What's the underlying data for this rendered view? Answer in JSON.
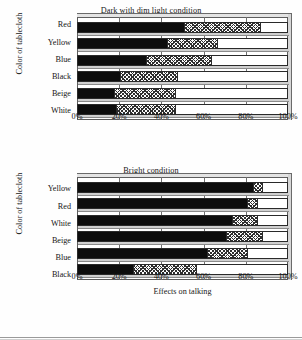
{
  "figure": {
    "background": "#ffffff",
    "ink": "#161616"
  },
  "charts": [
    {
      "id": "dark-dim-light",
      "title": "Dark with dim light condition",
      "ylabel": "Color of tablecloth",
      "xlabel": "",
      "xticks": [
        "0%",
        "20%",
        "40%",
        "60%",
        "80%",
        "100%"
      ],
      "xtick_values": [
        0,
        20,
        40,
        60,
        80,
        100
      ],
      "categories": [
        "Red",
        "Yellow",
        "Blue",
        "Black",
        "Beige",
        "White"
      ],
      "series": [
        {
          "name": "solid-black",
          "fill": "solid",
          "values": [
            51,
            43,
            33,
            21,
            18,
            19
          ]
        },
        {
          "name": "cross-hatch",
          "fill": "hatch",
          "values": [
            36,
            24,
            31,
            27,
            29,
            28
          ]
        },
        {
          "name": "open-white",
          "fill": "open",
          "values": [
            13,
            33,
            36,
            52,
            53,
            53
          ]
        }
      ],
      "cumulative": [
        {
          "category": "Red",
          "solid_end": 51,
          "hatch_end": 87
        },
        {
          "category": "Yellow",
          "solid_end": 43,
          "hatch_end": 67
        },
        {
          "category": "Blue",
          "solid_end": 33,
          "hatch_end": 64
        },
        {
          "category": "Black",
          "solid_end": 21,
          "hatch_end": 48
        },
        {
          "category": "Beige",
          "solid_end": 18,
          "hatch_end": 47
        },
        {
          "category": "White",
          "solid_end": 19,
          "hatch_end": 47
        }
      ]
    },
    {
      "id": "bright",
      "title": "Bright condition",
      "ylabel": "Color of tablecloth",
      "xlabel": "Effects on talking",
      "xticks": [
        "0%",
        "20%",
        "40%",
        "60%",
        "80%",
        "100%"
      ],
      "xtick_values": [
        0,
        20,
        40,
        60,
        80,
        100
      ],
      "categories": [
        "Yellow",
        "Red",
        "White",
        "Beige",
        "Blue",
        "Black"
      ],
      "series": [
        {
          "name": "solid-black",
          "fill": "solid",
          "values": [
            84,
            81,
            74,
            71,
            62,
            27
          ]
        },
        {
          "name": "cross-hatch",
          "fill": "hatch",
          "values": [
            4,
            5,
            12,
            17,
            19,
            30
          ]
        },
        {
          "name": "open-white",
          "fill": "open",
          "values": [
            12,
            14,
            14,
            12,
            19,
            43
          ]
        }
      ],
      "cumulative": [
        {
          "category": "Yellow",
          "solid_end": 84,
          "hatch_end": 88
        },
        {
          "category": "Red",
          "solid_end": 81,
          "hatch_end": 86
        },
        {
          "category": "White",
          "solid_end": 74,
          "hatch_end": 86
        },
        {
          "category": "Beige",
          "solid_end": 71,
          "hatch_end": 88
        },
        {
          "category": "Blue",
          "solid_end": 62,
          "hatch_end": 81
        },
        {
          "category": "Black",
          "solid_end": 27,
          "hatch_end": 57
        }
      ]
    }
  ],
  "chart_data": {
    "type": "bar",
    "orientation": "horizontal",
    "stacked": true,
    "normalized_percent": true,
    "panels": [
      {
        "title": "Dark with dim light condition",
        "xlabel": "",
        "ylabel": "Color of tablecloth",
        "xlim": [
          0,
          100
        ],
        "xticks": [
          0,
          20,
          40,
          60,
          80,
          100
        ],
        "xticklabels": [
          "0%",
          "20%",
          "40%",
          "60%",
          "80%",
          "100%"
        ],
        "grid": true,
        "legend": "none",
        "categories": [
          "Red",
          "Yellow",
          "Blue",
          "Black",
          "Beige",
          "White"
        ],
        "series": [
          {
            "name": "solid-black",
            "values": [
              51,
              43,
              33,
              21,
              18,
              19
            ]
          },
          {
            "name": "cross-hatch",
            "values": [
              36,
              24,
              31,
              27,
              29,
              28
            ]
          },
          {
            "name": "open-white",
            "values": [
              13,
              33,
              36,
              52,
              53,
              53
            ]
          }
        ]
      },
      {
        "title": "Bright condition",
        "xlabel": "Effects on talking",
        "ylabel": "Color of tablecloth",
        "xlim": [
          0,
          100
        ],
        "xticks": [
          0,
          20,
          40,
          60,
          80,
          100
        ],
        "xticklabels": [
          "0%",
          "20%",
          "40%",
          "60%",
          "80%",
          "100%"
        ],
        "grid": true,
        "legend": "none",
        "categories": [
          "Yellow",
          "Red",
          "White",
          "Beige",
          "Blue",
          "Black"
        ],
        "series": [
          {
            "name": "solid-black",
            "values": [
              84,
              81,
              74,
              71,
              62,
              27
            ]
          },
          {
            "name": "cross-hatch",
            "values": [
              4,
              5,
              12,
              17,
              19,
              30
            ]
          },
          {
            "name": "open-white",
            "values": [
              12,
              14,
              14,
              12,
              19,
              43
            ]
          }
        ]
      }
    ]
  }
}
